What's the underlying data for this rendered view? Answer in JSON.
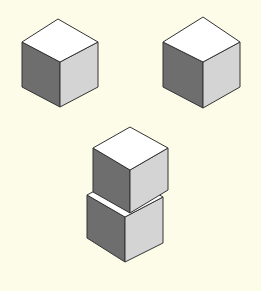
{
  "colors": {
    "background": "#fdfce9",
    "top_face": "#ffffff",
    "left_face": "#6e6e6e",
    "right_face": "#d4d4d4",
    "stroke": "#333333"
  },
  "cubes": [
    {
      "name": "cube-top-left",
      "top": [
        58,
        19
      ],
      "lt": [
        22,
        42
      ],
      "rt": [
        98,
        42
      ],
      "c": [
        60,
        62
      ],
      "lb": [
        22,
        87
      ],
      "rb": [
        98,
        87
      ],
      "b": [
        60,
        107
      ]
    },
    {
      "name": "cube-top-right",
      "top": [
        203,
        17
      ],
      "lt": [
        163,
        42
      ],
      "rt": [
        240,
        42
      ],
      "c": [
        203,
        62
      ],
      "lb": [
        163,
        87
      ],
      "rb": [
        240,
        87
      ],
      "b": [
        203,
        108
      ]
    },
    {
      "name": "cube-stack-bottom",
      "top": [
        125,
        175
      ],
      "lt": [
        87,
        195
      ],
      "rt": [
        163,
        197
      ],
      "c": [
        125,
        217
      ],
      "lb": [
        87,
        238
      ],
      "rb": [
        163,
        243
      ],
      "b": [
        125,
        262
      ]
    },
    {
      "name": "cube-stack-top",
      "top": [
        130,
        127
      ],
      "lt": [
        93,
        148
      ],
      "rt": [
        168,
        148
      ],
      "c": [
        130,
        170
      ],
      "lb": [
        93,
        192
      ],
      "rb": [
        168,
        190
      ],
      "b": [
        130,
        213
      ]
    }
  ]
}
